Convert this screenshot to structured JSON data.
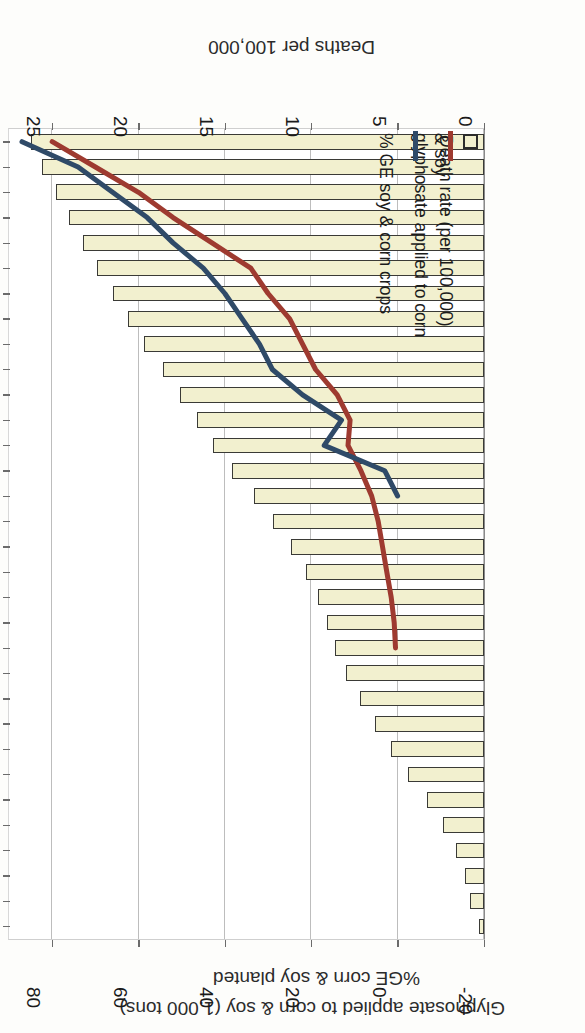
{
  "chart_data": {
    "type": "bar",
    "title": "",
    "orientation": "horizontal-bars-with-two-overlaid-lines",
    "note": "Figure is printed rotated 180 degrees (upside down) in the source image.",
    "xlabel_bottom": "Deaths per 100,000",
    "xlabel_top_1": "%GE corn & soy planted",
    "xlabel_top_2": "Glyphosate applied to corn & soy (1,000 tons)",
    "ylabel": "Year",
    "bottom_axis": {
      "label": "Deaths per 100,000",
      "ticks": [
        "0",
        "5",
        "10",
        "15",
        "20",
        "25"
      ],
      "min": 0,
      "max": 27.5
    },
    "top_axis": {
      "label_line1": "%GE corn & soy planted",
      "label_line2": "Glyphosate applied to corn & soy (1,000 tons)",
      "ticks": [
        "-20",
        "0",
        "20",
        "40",
        "60",
        "80"
      ],
      "min": -20,
      "max": 90
    },
    "year_ticks": [
      "1979",
      "1981",
      "1983",
      "1985",
      "1987",
      "1989",
      "1991",
      "1993",
      "1995",
      "1997",
      "1999",
      "2001",
      "2003",
      "2005",
      "2007",
      "2009"
    ],
    "categories": [
      1979,
      1980,
      1981,
      1982,
      1983,
      1984,
      1985,
      1986,
      1987,
      1988,
      1989,
      1990,
      1991,
      1992,
      1993,
      1994,
      1995,
      1996,
      1997,
      1998,
      1999,
      2000,
      2001,
      2002,
      2003,
      2004,
      2005,
      2006,
      2007,
      2008,
      2009,
      2010
    ],
    "legend": {
      "position": "inside-lower-left",
      "entries": [
        {
          "label": "Death rate (per 100,000)",
          "marker": "box",
          "color": "#f2f0cf",
          "edge": "#2c2c2c"
        },
        {
          "label": "glyphosate applied to corn & soy",
          "marker": "line",
          "color": "#9e3a30"
        },
        {
          "label": "% GE soy & corn crops",
          "marker": "line",
          "color": "#2f4a68"
        }
      ],
      "entry2_line1": "glyphosate applied to corn",
      "entry2_line2": "& soy",
      "entry3_line1": "% GE soy & corn crops"
    },
    "series": [
      {
        "name": "Death rate (per 100,000)",
        "type": "bar",
        "axis": "bottom",
        "color": "#f2f0cf",
        "edge": "#3a3a36",
        "values": [
          0.3,
          0.8,
          1.1,
          1.6,
          2.4,
          3.3,
          4.4,
          5.4,
          6.3,
          7.2,
          8.0,
          8.6,
          9.1,
          9.6,
          10.3,
          11.2,
          12.2,
          13.3,
          14.6,
          15.7,
          16.6,
          17.6,
          18.6,
          19.7,
          20.6,
          21.5,
          22.4,
          23.2,
          24.0,
          24.8,
          25.6,
          26.2
        ]
      },
      {
        "name": "glyphosate applied to corn & soy",
        "type": "line",
        "axis": "top",
        "color": "#9e3a30",
        "start_year": 1990,
        "values": [
          null,
          null,
          null,
          null,
          null,
          null,
          null,
          null,
          null,
          null,
          null,
          0.5,
          0.8,
          1.5,
          2.5,
          3.5,
          4.5,
          6.0,
          8.5,
          11.5,
          11.0,
          14.0,
          19.0,
          22.0,
          25.0,
          30.0,
          34.0,
          43.0,
          52.0,
          60.0,
          70.0,
          80.0
        ]
      },
      {
        "name": "% GE soy & corn crops",
        "type": "line",
        "axis": "top",
        "color": "#2f4a68",
        "start_year": 1996,
        "values": [
          null,
          null,
          null,
          null,
          null,
          null,
          null,
          null,
          null,
          null,
          null,
          null,
          null,
          null,
          null,
          null,
          null,
          0.0,
          3.0,
          17.0,
          13.0,
          22.0,
          29.0,
          32.0,
          36.0,
          40.0,
          45.0,
          52.0,
          58.0,
          66.0,
          74.0,
          87.0
        ]
      }
    ]
  }
}
